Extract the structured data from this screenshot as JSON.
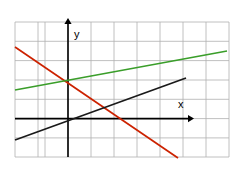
{
  "figure": {
    "name": "coordinate-plane-three-lines",
    "background_color": "#ffffff",
    "width": 239,
    "height": 170
  },
  "grid": {
    "color": "#b0b0b0",
    "stroke_width": 0.8,
    "visible": true,
    "cell_width": 23,
    "cell_height": 19.3,
    "x_positions": [
      15,
      38,
      45,
      68,
      91,
      114,
      137,
      160,
      183,
      206,
      229
    ],
    "y_positions": [
      22,
      41.3,
      60.6,
      80,
      99.3,
      118.6,
      137.9,
      157
    ]
  },
  "axes": {
    "color": "#000000",
    "stroke_width": 1.6,
    "origin": {
      "x": 68,
      "y": 118.6
    },
    "x_axis": {
      "label": "x",
      "label_x": 178,
      "label_y": 108,
      "from_x": 15,
      "to_x": 188,
      "y": 118.6,
      "arrow": "right"
    },
    "y_axis": {
      "label": "y",
      "label_x": 74,
      "label_y": 38,
      "x": 68,
      "from_y": 157,
      "to_y": 24,
      "arrow": "up"
    }
  },
  "chart_data": {
    "type": "line",
    "title": "",
    "xlabel": "x",
    "ylabel": "y",
    "grid": true,
    "legend": "none",
    "xlim": [
      -2.3,
      7
    ],
    "ylim": [
      -2,
      5
    ],
    "series": [
      {
        "name": "red-line",
        "color": "#cc2200",
        "stroke_width": 1.7,
        "slope": -1,
        "intercept": 2,
        "points_px": [
          [
            15,
            47
          ],
          [
            178,
            158
          ]
        ],
        "x_intercept": 2,
        "y_intercept": 2
      },
      {
        "name": "green-line",
        "color": "#3a9e2a",
        "stroke_width": 1.7,
        "slope": 0.25,
        "intercept": 2,
        "points_px": [
          [
            15,
            90
          ],
          [
            227,
            51
          ]
        ],
        "x_intercept": -8,
        "y_intercept": 2
      },
      {
        "name": "black-line",
        "color": "#1a1a1a",
        "stroke_width": 1.7,
        "slope": 0.5,
        "intercept": 0,
        "points_px": [
          [
            15,
            140
          ],
          [
            186,
            78
          ]
        ],
        "x_intercept": 0,
        "y_intercept": 0
      }
    ],
    "intersections": [
      {
        "name": "red-green-on-y-axis",
        "x_px": 68,
        "y_px": 80
      },
      {
        "name": "red-black",
        "x_px": 114,
        "y_px": 102
      },
      {
        "name": "black-x-axis-origin",
        "x_px": 68,
        "y_px": 118.6
      }
    ]
  }
}
